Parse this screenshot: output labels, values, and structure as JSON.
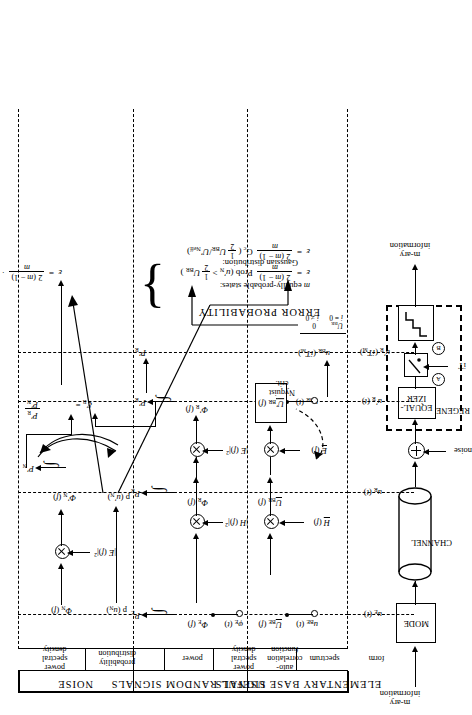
{
  "figure": {
    "orientation": "rotated-90",
    "title_sections": [
      "ELEMENTARY BASE SIGNALS",
      "USEFUL RANDOM SIGNALS",
      "NOISE"
    ]
  },
  "sections": {
    "elementary": {
      "title": "ELEMENTARY BASE SIGNALS",
      "columns": [
        "form",
        "spectrum"
      ]
    },
    "useful": {
      "title": "USEFUL RANDOM SIGNALS",
      "columns": [
        "auto-correlation function",
        "power spectral density",
        "power"
      ]
    },
    "noise": {
      "title": "NOISE",
      "columns": [
        "probability distribution",
        "power spectral density"
      ]
    }
  },
  "column_labels": {
    "form": "form",
    "spectrum": "spectrum",
    "autocorr": "auto-\ncorrelation\nfunction",
    "psd": "power\nspectral\ndensity",
    "power": "power",
    "prob": "probability\ndistribution",
    "psd_noise": "power\nspectral\ndensity"
  },
  "rows": {
    "row1_label": "u_E(t)",
    "row2_label": "u_R(t)",
    "row3_label": "u'_R(t)",
    "row4_label": "u'_R(iT_M)"
  },
  "symbols": {
    "u_BE_t": "u",
    "u_BE_t_sub": "BE",
    "u_BE_t_arg": "(t)",
    "U_BE_f": "U",
    "U_BE_f_sub": "BE",
    "U_BE_f_arg": "(f)",
    "u_BR_t": "u",
    "u_BR_t_sub": "BR",
    "u_BR_t_arg": "(t)",
    "U_BR_f": "U",
    "U_BR_f_sub": "BR",
    "U_BR_f_arg": "(f)",
    "U_BR_prime_f": "U'",
    "U_BR_prime_sub": "BR",
    "U_BR_prime_arg": "(f)",
    "H_f": "H(f)",
    "E_f": "E(f)",
    "H_f_sq": "|H(f)|²",
    "E_f_sq": "|E(f)|²",
    "phi_E_t": "φ",
    "phi_E_t_sub": "E",
    "phi_E_t_arg": "(t)",
    "Phi_E_f": "Φ",
    "Phi_E_f_sub": "E",
    "Phi_E_f_arg": "(f)",
    "Phi_R_f": "Φ",
    "Phi_R_f_sub": "R",
    "Phi_R_f_arg": "(f)",
    "Phi_R_prime_f": "Φ'",
    "Phi_R_prime_sub": "R",
    "Phi_R_prime_arg": "(f)",
    "Phi_N_f": "Φ",
    "Phi_N_f_sub": "N",
    "Phi_N_f_arg": "(f)",
    "Phi_N_prime_f": "Φ'",
    "Phi_N_prime_sub": "N",
    "Phi_N_prime_arg": "(f)",
    "P_E": "P",
    "P_E_sub": "E",
    "P_R": "P",
    "P_R_sub": "R",
    "P_R_prime": "P'",
    "P_R_prime_sub": "R",
    "P_R_bar": "P̄'",
    "P_R_bar_sub": "R",
    "P_N_prime": "P'",
    "P_N_prime_sub": "N",
    "p_uN": "p (u",
    "p_uN_sub": "N",
    "p_uN_close": ")",
    "p_uN_prime": "p (u'",
    "p_uN_prime_sub": "N",
    "p_uN_prime_close": ")",
    "nyquist": "Nyquist\ncrit.",
    "u_BR_iTM": "u",
    "u_BR_iTM_sub": "BR",
    "u_BR_iTM_arg": "(iT",
    "u_BR_iTM_sub2": "M",
    "u_BR_iTM_close": ")",
    "U_BR_const": "U",
    "U_BR_const_sub": "BR",
    "i_eq_0": "i = 0",
    "zero": "0",
    "i_ne_0": "i ≠ 0",
    "xi_R": "ξ'",
    "xi_R_sub": "R",
    "xi_eq": "=",
    "xi_num": "P'",
    "xi_num_sub": "R",
    "xi_den": "P'",
    "xi_den_sub": "N"
  },
  "equations": {
    "noise_eq_lhs": "ε  =",
    "noise_eq_num": "2 (m − 1)",
    "noise_eq_den": "m",
    "noise_eq_rhs": "· f [ξ'R , p (u'N)]",
    "eq1_lhs": "ε  =",
    "eq1_num": "2 (m − 1)",
    "eq1_den": "m",
    "eq1_rhs": "Prob (u'N >  ½ U BR )",
    "eq2_lhs": "ε  =",
    "eq2_num": "2 (m − 1)",
    "eq2_den": "m",
    "eq2_rhs": "Gc ( ½ U BR / U'Neff )",
    "brace_top_label": "m equally-probable states:",
    "brace_bottom_label": "Gaussian distribution:",
    "error_probability": "ERROR PROBABILITY"
  },
  "block_diagram": {
    "input_label": "m-ary\ninformation",
    "output_label": "m-ary\ninformation",
    "modem": "MODE",
    "channel": "CHANNEL",
    "noise": "noise",
    "equalizer": "EQUAL-\nIZER",
    "regenerator": "REGENERATOR",
    "clock": "iṪ",
    "point_a": "A",
    "point_b": "B",
    "tap_uE": "u",
    "tap_uE_sub": "E",
    "tap_uE_arg": "(t)",
    "tap_uR": "u",
    "tap_uR_sub": "R",
    "tap_uR_arg": "(t)",
    "tap_uRp": "u'",
    "tap_uRp_sub": "R",
    "tap_uRp_arg": "(t)",
    "tap_uRpi": "u'",
    "tap_uRpi_sub": "R",
    "tap_uRpi_arg": "(iT",
    "tap_uRpi_sub2": "M",
    "tap_uRpi_close": ")"
  },
  "colors": {
    "ink": "#000000",
    "paper": "#ffffff"
  }
}
